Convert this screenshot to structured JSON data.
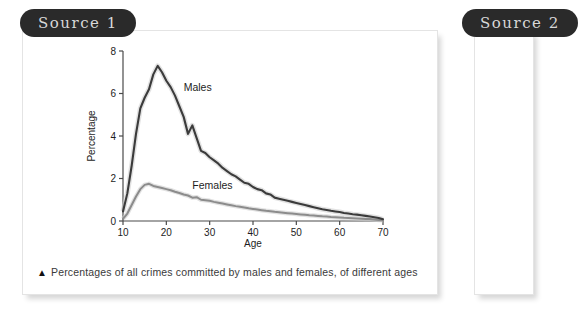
{
  "panels": [
    {
      "badge_label": "Source 1"
    },
    {
      "badge_label": "Source 2"
    }
  ],
  "figure": {
    "caption_marker": "▲",
    "caption": "Percentages of all crimes committed by males and females, of different ages"
  },
  "chart_data": {
    "type": "line",
    "title": "",
    "xlabel": "Age",
    "ylabel": "Percentage",
    "xlim": [
      10,
      70
    ],
    "ylim": [
      0,
      8
    ],
    "xticks": [
      10,
      20,
      30,
      40,
      50,
      60,
      70
    ],
    "yticks": [
      0,
      2,
      4,
      6,
      8
    ],
    "grid": false,
    "legend": "inline-labels",
    "annotations": [
      {
        "text": "Males",
        "x": 24,
        "y": 6.1
      },
      {
        "text": "Females",
        "x": 26,
        "y": 1.5
      }
    ],
    "colors": {
      "males": "#3b3b3b",
      "females": "#8c8c8c",
      "axis": "#4a4a4a"
    },
    "x": [
      10,
      11,
      12,
      13,
      14,
      15,
      16,
      17,
      18,
      19,
      20,
      21,
      22,
      23,
      24,
      25,
      26,
      27,
      28,
      29,
      30,
      31,
      32,
      33,
      34,
      35,
      36,
      37,
      38,
      39,
      40,
      41,
      42,
      43,
      44,
      45,
      46,
      47,
      48,
      49,
      50,
      51,
      52,
      53,
      54,
      55,
      56,
      57,
      58,
      59,
      60,
      61,
      62,
      63,
      64,
      65,
      66,
      67,
      68,
      69,
      70
    ],
    "series": [
      {
        "name": "Males",
        "values": [
          0.45,
          1.3,
          2.6,
          4.1,
          5.3,
          5.8,
          6.2,
          6.9,
          7.3,
          7.0,
          6.6,
          6.3,
          5.9,
          5.4,
          4.9,
          4.1,
          4.5,
          3.9,
          3.3,
          3.2,
          3.0,
          2.85,
          2.7,
          2.5,
          2.35,
          2.2,
          2.1,
          1.95,
          1.8,
          1.75,
          1.6,
          1.5,
          1.45,
          1.3,
          1.25,
          1.1,
          1.05,
          1.0,
          0.95,
          0.9,
          0.85,
          0.8,
          0.75,
          0.7,
          0.65,
          0.6,
          0.55,
          0.52,
          0.48,
          0.45,
          0.42,
          0.38,
          0.35,
          0.32,
          0.3,
          0.27,
          0.24,
          0.21,
          0.18,
          0.14,
          0.08
        ]
      },
      {
        "name": "Females",
        "values": [
          0.1,
          0.35,
          0.75,
          1.15,
          1.5,
          1.7,
          1.75,
          1.65,
          1.6,
          1.55,
          1.5,
          1.45,
          1.38,
          1.32,
          1.25,
          1.2,
          1.1,
          1.12,
          1.0,
          0.98,
          0.95,
          0.9,
          0.86,
          0.82,
          0.78,
          0.74,
          0.7,
          0.67,
          0.64,
          0.6,
          0.57,
          0.54,
          0.51,
          0.48,
          0.46,
          0.43,
          0.41,
          0.39,
          0.37,
          0.35,
          0.33,
          0.31,
          0.29,
          0.27,
          0.26,
          0.24,
          0.22,
          0.21,
          0.19,
          0.18,
          0.17,
          0.15,
          0.14,
          0.13,
          0.12,
          0.11,
          0.1,
          0.09,
          0.07,
          0.05,
          0.03
        ]
      }
    ]
  }
}
